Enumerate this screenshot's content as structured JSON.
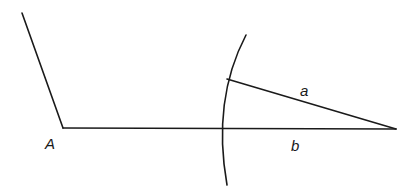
{
  "diagram": {
    "type": "geometric-construction",
    "labels": {
      "vertex": "A",
      "segment_a": "a",
      "segment_b": "b"
    },
    "colors": {
      "line": "#1a1a1a",
      "background": "#ffffff"
    }
  }
}
